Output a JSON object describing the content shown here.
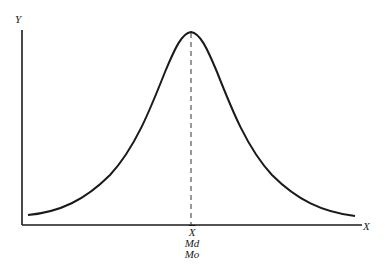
{
  "figure": {
    "axes": {
      "y_label": "Y",
      "x_label": "X"
    },
    "center_labels": {
      "mean": "X",
      "median": "Md",
      "mode": "Mo"
    },
    "colors": {
      "line": "#1a1a1a",
      "background": "#ffffff"
    },
    "geometry": {
      "origin": [
        22,
        225
      ],
      "y_axis_top": [
        22,
        30
      ],
      "x_axis_right": [
        362,
        225
      ],
      "peak": [
        191,
        32
      ],
      "curve_left_end": [
        28,
        215
      ],
      "curve_right_end": [
        355,
        216
      ]
    }
  }
}
